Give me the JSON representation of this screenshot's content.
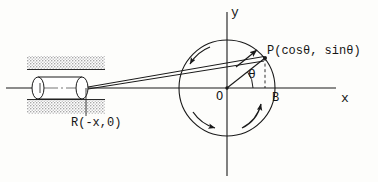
{
  "figure": {
    "background_color": "#fdfdfb",
    "ink_color": "#1a1a1a",
    "rail_color": "#b9b9b9"
  },
  "axes": {
    "y_label": "y",
    "x_label": "x",
    "origin_label": "O",
    "origin_px": {
      "x": 227,
      "y": 88
    },
    "x_axis": {
      "x1": 6,
      "y1": 88,
      "x2": 336,
      "y2": 88
    },
    "y_axis": {
      "x1": 227,
      "y1": 12,
      "x2": 227,
      "y2": 176
    }
  },
  "circle": {
    "center": {
      "x": 227,
      "y": 88
    },
    "radius": 48,
    "name": "unit-circle"
  },
  "points": {
    "P": {
      "label": "P(cosθ, sinθ)",
      "short_label": "P",
      "coords_text": "(cosθ, sinθ)",
      "px": {
        "x": 265,
        "y": 58
      }
    },
    "B": {
      "label": "B",
      "px": {
        "x": 265,
        "y": 88
      }
    },
    "O": {
      "label": "O",
      "px": {
        "x": 227,
        "y": 88
      }
    },
    "R": {
      "label": "R(-x,0)",
      "px": {
        "x": 86,
        "y": 88
      }
    }
  },
  "angle": {
    "label": "θ",
    "vertex": "O",
    "from": "positive x-axis",
    "to": "OP radius",
    "degrees": 38
  },
  "slider": {
    "name": "piston-cylinder",
    "body": {
      "x": 32,
      "y": 76,
      "width": 54,
      "height": 24
    },
    "rail_top": {
      "x": 27,
      "y": 56,
      "width": 78,
      "height": 12
    },
    "rail_bottom": {
      "x": 27,
      "y": 99,
      "width": 78,
      "height": 14
    },
    "guide_line_top_y": 74,
    "guide_line_bottom_y": 100
  },
  "connecting_rod": {
    "name": "connecting-rod",
    "from": "R",
    "to": "P",
    "arrow_at": "P",
    "mid_arrow": true
  },
  "rotation_arrows": [
    {
      "name": "rotation-arrow-upper-left",
      "direction": "counterclockwise"
    },
    {
      "name": "rotation-arrow-lower-left",
      "direction": "counterclockwise"
    },
    {
      "name": "rotation-arrow-lower-right",
      "direction": "counterclockwise"
    }
  ],
  "dashed_drop_line": {
    "name": "p-to-b-dashed-line",
    "from": "P",
    "to": "B"
  }
}
